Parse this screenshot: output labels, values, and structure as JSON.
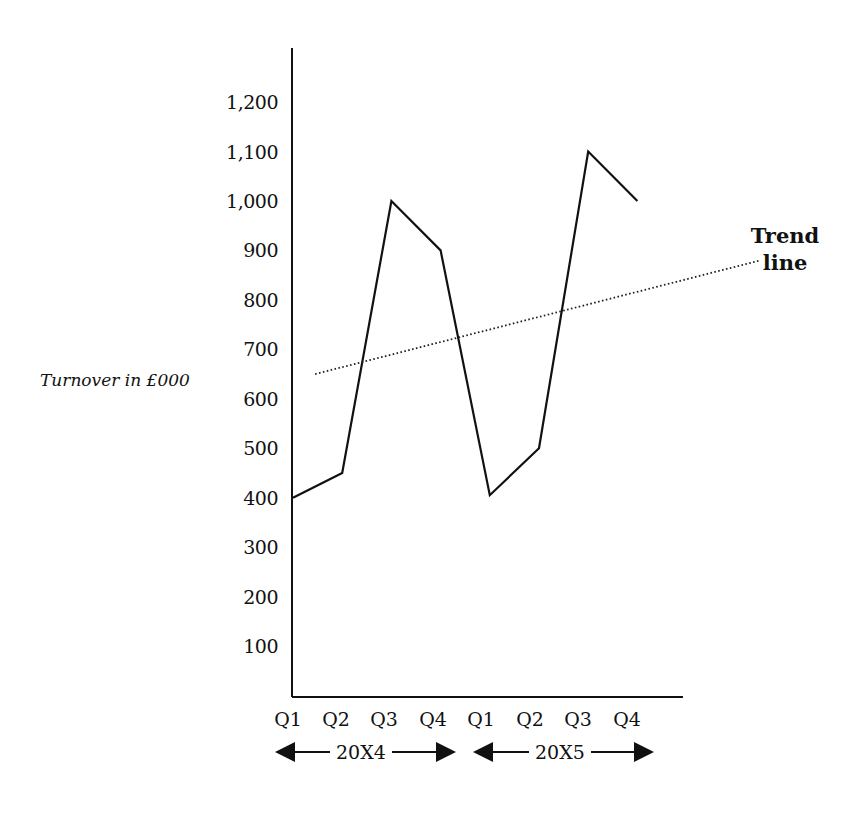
{
  "chart_data": {
    "type": "line",
    "title": "",
    "xlabel": "",
    "ylabel": "Turnover in £000",
    "categories": [
      "Q1",
      "Q2",
      "Q3",
      "Q4",
      "Q1",
      "Q2",
      "Q3",
      "Q4"
    ],
    "periods": [
      {
        "label": "20X4",
        "quarters": [
          "Q1",
          "Q2",
          "Q3",
          "Q4"
        ]
      },
      {
        "label": "20X5",
        "quarters": [
          "Q1",
          "Q2",
          "Q3",
          "Q4"
        ]
      }
    ],
    "series": [
      {
        "name": "Turnover",
        "style": "solid",
        "values": [
          400,
          450,
          1000,
          900,
          405,
          500,
          1100,
          1000
        ]
      },
      {
        "name": "Trend line",
        "style": "dotted",
        "start": {
          "x_index": 0.45,
          "value": 650
        },
        "end": {
          "x_index": 9.5,
          "value": 880
        }
      }
    ],
    "yticks": [
      100,
      200,
      300,
      400,
      500,
      600,
      700,
      800,
      900,
      1000,
      1100,
      1200
    ],
    "ytick_labels": [
      "100",
      "200",
      "300",
      "400",
      "500",
      "600",
      "700",
      "800",
      "900",
      "1,000",
      "1,100",
      "1,200"
    ],
    "ylim": [
      0,
      1300
    ],
    "grid": false,
    "legend": null,
    "annotations": [
      {
        "text": "Trend line",
        "target": "Trend line"
      }
    ]
  },
  "labels": {
    "ylabel": "Turnover in £000",
    "annotation_line1": "Trend",
    "annotation_line2": "line",
    "period1": "20X4",
    "period2": "20X5"
  }
}
